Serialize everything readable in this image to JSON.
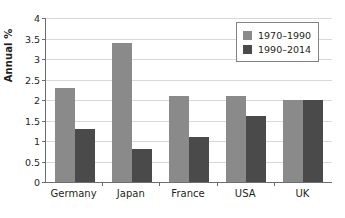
{
  "chart_data": {
    "type": "bar",
    "title": "",
    "subtitle": "",
    "xlabel": "",
    "ylabel": "Annual %",
    "ylim": [
      0,
      4
    ],
    "ytick_step": 0.5,
    "ytick_labels": [
      "0",
      "0.5",
      "1",
      "1.5",
      "2",
      "2.5",
      "3",
      "3.5",
      "4"
    ],
    "ytick_values": [
      0,
      0.5,
      1,
      1.5,
      2,
      2.5,
      3,
      3.5,
      4
    ],
    "grid": "horizontal",
    "legend_position": "top-right",
    "categories": [
      "Germany",
      "Japan",
      "France",
      "USA",
      "UK"
    ],
    "series": [
      {
        "name": "1970–1990",
        "color": "#8a8a8a",
        "values": [
          2.3,
          3.4,
          2.1,
          2.1,
          2.0
        ]
      },
      {
        "name": "1990–2014",
        "color": "#4a4a4a",
        "values": [
          1.3,
          0.8,
          1.1,
          1.6,
          2.0
        ]
      }
    ],
    "annotations": []
  },
  "legend": {
    "items": [
      {
        "label": "1970–1990",
        "color": "#8a8a8a"
      },
      {
        "label": "1990–2014",
        "color": "#4a4a4a"
      }
    ]
  },
  "colors": {
    "series_light": "#8a8a8a",
    "series_dark": "#4a4a4a",
    "gridline": "#d9d9d9",
    "axis": "#6d6e71",
    "text": "#231f20",
    "background": "#ffffff"
  }
}
